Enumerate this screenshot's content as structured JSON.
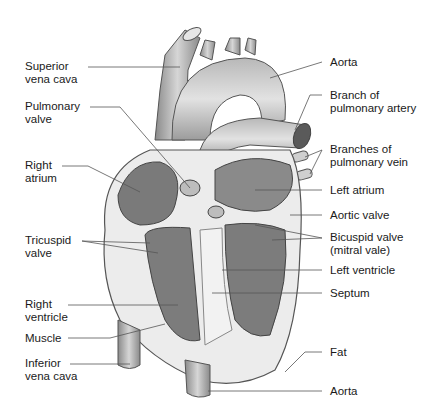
{
  "diagram": {
    "left_labels": [
      {
        "id": "superior-vena-cava",
        "text": "Superior\nvena cava"
      },
      {
        "id": "pulmonary-valve",
        "text": "Pulmonary\nvalve"
      },
      {
        "id": "right-atrium",
        "text": "Right\natrium"
      },
      {
        "id": "tricuspid-valve",
        "text": "Tricuspid\nvalve"
      },
      {
        "id": "right-ventricle",
        "text": "Right\nventricle"
      },
      {
        "id": "muscle",
        "text": "Muscle"
      },
      {
        "id": "inferior-vena-cava",
        "text": "Inferior\nvena cava"
      }
    ],
    "right_labels": [
      {
        "id": "aorta-top",
        "text": "Aorta"
      },
      {
        "id": "branch-pulmonary-artery",
        "text": "Branch of\npulmonary artery"
      },
      {
        "id": "branches-pulmonary-vein",
        "text": "Branches of\npulmonary vein"
      },
      {
        "id": "left-atrium",
        "text": "Left atrium"
      },
      {
        "id": "aortic-valve",
        "text": "Aortic valve"
      },
      {
        "id": "bicuspid-valve",
        "text": "Bicuspid valve\n(mitral vale)"
      },
      {
        "id": "left-ventricle",
        "text": "Left ventricle"
      },
      {
        "id": "septum",
        "text": "Septum"
      },
      {
        "id": "fat",
        "text": "Fat"
      },
      {
        "id": "aorta-bottom",
        "text": "Aorta"
      }
    ],
    "colors": {
      "tissue_dark": "#6e6e6e",
      "tissue_mid": "#9a9a9a",
      "tissue_light": "#c8c8c8",
      "muscle_wall": "#ececec",
      "leader_line": "#555555"
    }
  }
}
